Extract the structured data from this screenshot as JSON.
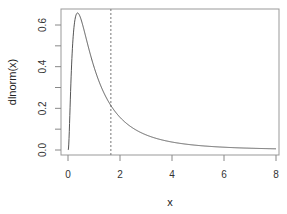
{
  "chart_data": {
    "type": "line",
    "title": "",
    "xlabel": "x",
    "ylabel": "dlnorm(x)",
    "xlim": [
      -0.3,
      8.3
    ],
    "ylim": [
      -0.02,
      0.68
    ],
    "x_ticks": [
      0,
      2,
      4,
      6,
      8
    ],
    "x_tick_labels": [
      "0",
      "2",
      "4",
      "6",
      "8"
    ],
    "y_ticks": [
      0.0,
      0.1,
      0.2,
      0.3,
      0.4,
      0.5,
      0.6
    ],
    "y_tick_labels": [
      "0.0",
      "",
      "0.2",
      "",
      "0.4",
      "",
      "0.6"
    ],
    "grid": false,
    "legend": null,
    "series": [
      {
        "name": "dlnorm(x)",
        "function": "lognormal density, meanlog=0, sdlog=1",
        "x": [
          0.0,
          0.1,
          0.2,
          0.368,
          0.5,
          0.75,
          1.0,
          1.25,
          1.5,
          2.0,
          2.5,
          3.0,
          4.0,
          5.0,
          6.0,
          7.0,
          8.0
        ],
        "values": [
          0.0,
          0.282,
          0.546,
          0.658,
          0.627,
          0.528,
          0.399,
          0.301,
          0.245,
          0.157,
          0.104,
          0.073,
          0.036,
          0.022,
          0.014,
          0.009,
          0.006
        ],
        "color": "#555555"
      }
    ],
    "annotations": [
      {
        "type": "vline",
        "x": 1.6487,
        "style": "dashed",
        "color": "#777777",
        "label": ""
      }
    ]
  }
}
